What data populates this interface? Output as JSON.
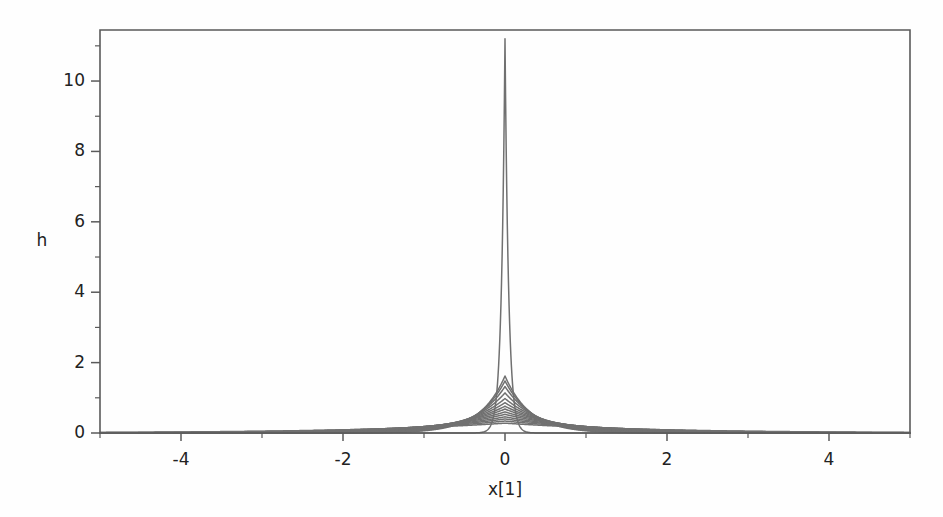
{
  "figure": {
    "background_color": "#fefefe",
    "frame_color": "#5a5a5a",
    "curve_color": "#707070"
  },
  "axes": {
    "y_axis_title": "h",
    "x_axis_title": "x[1]",
    "x_tick_labels": [
      "-4",
      "-2",
      "0",
      "2",
      "4"
    ],
    "y_tick_labels": [
      "0",
      "2",
      "4",
      "6",
      "8",
      "10"
    ]
  },
  "chart_data": {
    "type": "line",
    "title": "",
    "subtitle": "",
    "xlabel": "x[1]",
    "ylabel": "h",
    "xlim": [
      -5,
      5
    ],
    "ylim": [
      0,
      11.45
    ],
    "grid": false,
    "legend": "none",
    "x_major_ticks": [
      -4,
      -2,
      0,
      2,
      4
    ],
    "x_minor_ticks": [
      -5,
      -3,
      -1,
      1,
      3,
      5
    ],
    "y_major_ticks": [
      0,
      2,
      4,
      6,
      8,
      10
    ],
    "y_minor_ticks": [
      1,
      3,
      5,
      7,
      9,
      11
    ],
    "curve_family": "laplace-kernel-density",
    "series": [
      {
        "name": "h1",
        "peak": 11.2,
        "scale": 0.0446,
        "color": "#707070",
        "width": 1.5
      },
      {
        "name": "h2",
        "peak": 1.62,
        "scale": 0.3086,
        "color": "#707070",
        "width": 1.5
      },
      {
        "name": "h3",
        "peak": 1.48,
        "scale": 0.3378,
        "color": "#707070",
        "width": 1.5
      },
      {
        "name": "h4",
        "peak": 1.32,
        "scale": 0.3788,
        "color": "#707070",
        "width": 1.5
      },
      {
        "name": "h5",
        "peak": 1.14,
        "scale": 0.4386,
        "color": "#707070",
        "width": 1.5
      },
      {
        "name": "h6",
        "peak": 0.98,
        "scale": 0.5102,
        "color": "#707070",
        "width": 1.5
      },
      {
        "name": "h7",
        "peak": 0.86,
        "scale": 0.5814,
        "color": "#707070",
        "width": 1.5
      },
      {
        "name": "h8",
        "peak": 0.76,
        "scale": 0.6579,
        "color": "#707070",
        "width": 1.5
      },
      {
        "name": "h9",
        "peak": 0.68,
        "scale": 0.7353,
        "color": "#707070",
        "width": 1.5
      },
      {
        "name": "h10",
        "peak": 0.6,
        "scale": 0.8333,
        "color": "#707070",
        "width": 1.5
      },
      {
        "name": "h11",
        "peak": 0.53,
        "scale": 0.9434,
        "color": "#707070",
        "width": 1.5
      },
      {
        "name": "h12",
        "peak": 0.46,
        "scale": 1.087,
        "color": "#707070",
        "width": 1.5
      },
      {
        "name": "h13",
        "peak": 0.4,
        "scale": 1.25,
        "color": "#707070",
        "width": 1.5
      },
      {
        "name": "h14",
        "peak": 0.34,
        "scale": 1.4706,
        "color": "#707070",
        "width": 1.5
      },
      {
        "name": "h15",
        "peak": 0.28,
        "scale": 1.7857,
        "color": "#707070",
        "width": 1.5
      }
    ],
    "sampled_points": {
      "x": [
        -5,
        -4,
        -3,
        -2,
        -1.5,
        -1,
        -0.75,
        -0.5,
        -0.35,
        -0.2,
        -0.1,
        -0.05,
        0,
        0.05,
        0.1,
        0.2,
        0.35,
        0.5,
        0.75,
        1,
        1.5,
        2,
        3,
        4,
        5
      ],
      "tall_spike_h": [
        0.0,
        0.0,
        0.0,
        0.0,
        0.0,
        0.0,
        0.0,
        0.0,
        0.004,
        0.124,
        1.22,
        3.66,
        11.2,
        3.66,
        1.22,
        0.124,
        0.004,
        0.0,
        0.0,
        0.0,
        0.0,
        0.0,
        0.0,
        0.0,
        0.0
      ],
      "mid_curve_h": [
        0.0,
        0.0,
        0.01,
        0.03,
        0.09,
        0.16,
        0.27,
        0.45,
        0.61,
        0.85,
        1.16,
        1.36,
        1.62,
        1.36,
        1.16,
        0.85,
        0.61,
        0.45,
        0.27,
        0.16,
        0.09,
        0.03,
        0.01,
        0.0,
        0.0
      ],
      "broad_curve_h": [
        0.02,
        0.03,
        0.05,
        0.09,
        0.12,
        0.16,
        0.18,
        0.21,
        0.23,
        0.25,
        0.27,
        0.275,
        0.28,
        0.275,
        0.27,
        0.25,
        0.23,
        0.21,
        0.18,
        0.16,
        0.12,
        0.09,
        0.05,
        0.03,
        0.02
      ]
    }
  },
  "layout": {
    "plot_left_px": 100,
    "plot_right_px": 910,
    "plot_top_px": 30,
    "plot_bottom_px": 433
  }
}
